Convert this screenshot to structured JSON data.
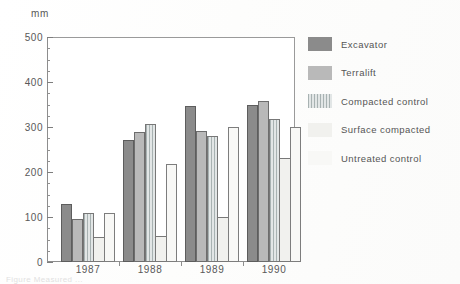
{
  "chart_data": {
    "type": "bar",
    "title": "",
    "xlabel": "",
    "ylabel": "mm",
    "unit_label": "mm",
    "ylim": [
      0,
      500
    ],
    "y_ticks": [
      0,
      100,
      200,
      300,
      400,
      500
    ],
    "y_minor_step": 25,
    "grid": false,
    "legend_position": "right",
    "categories": [
      "1987",
      "1988",
      "1989",
      "1990"
    ],
    "series": [
      {
        "name": "Excavator",
        "values": [
          130,
          272,
          347,
          350
        ],
        "color": "#8b8b8b"
      },
      {
        "name": "Terralift",
        "values": [
          95,
          290,
          292,
          358
        ],
        "color": "#b9b9b9"
      },
      {
        "name": "Compacted control",
        "values": [
          108,
          307,
          280,
          318
        ],
        "color": "#e2e6e6"
      },
      {
        "name": "Surface compacted",
        "values": [
          55,
          58,
          100,
          232
        ],
        "color": "#f1f1ee"
      },
      {
        "name": "Untreated control",
        "values": [
          108,
          218,
          300,
          300
        ],
        "color": "#f8f8f6"
      }
    ]
  },
  "axes": {
    "unit": "mm",
    "y_tick_labels": [
      "500",
      "400",
      "300",
      "200",
      "100",
      "0"
    ],
    "x_tick_labels": [
      "1987",
      "1988",
      "1989",
      "1990"
    ]
  },
  "legend": {
    "items": [
      {
        "label": "Excavator"
      },
      {
        "label": "Terralift"
      },
      {
        "label": "Compacted control"
      },
      {
        "label": "Surface compacted"
      },
      {
        "label": "Untreated control"
      }
    ]
  },
  "caption": {
    "text": "Figure  Measured  ..."
  }
}
